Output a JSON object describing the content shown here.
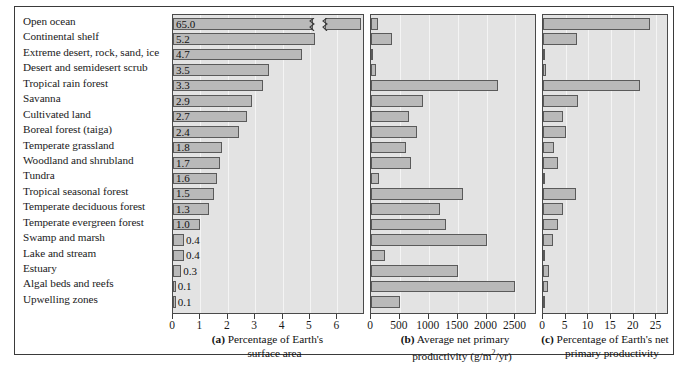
{
  "figure": {
    "ecosystems": [
      "Open ocean",
      "Continental shelf",
      "Extreme desert, rock, sand, ice",
      "Desert and semidesert scrub",
      "Tropical rain forest",
      "Savanna",
      "Cultivated land",
      "Boreal forest (taiga)",
      "Temperate grassland",
      "Woodland and shrubland",
      "Tundra",
      "Tropical seasonal forest",
      "Temperate deciduous forest",
      "Temperate evergreen forest",
      "Swamp and marsh",
      "Lake and stream",
      "Estuary",
      "Algal beds and reefs",
      "Upwelling zones"
    ],
    "panel_a": {
      "caption_letter": "(a)",
      "caption_line1": "Percentage of Earth's",
      "caption_line2": "surface area"
    },
    "panel_b": {
      "caption_letter": "(b)",
      "caption_line1": "Average net primary",
      "caption_line2_pre": "productivity (g/m",
      "caption_line2_sup": "2",
      "caption_line2_post": "/yr)"
    },
    "panel_c": {
      "caption_letter": "(c)",
      "caption_line1": "Percentage of Earth's net",
      "caption_line2": "primary productivity"
    },
    "colors": {
      "bar_fill": "#b9b9b9",
      "bar_stroke": "#5a5a5a",
      "panel_bg": "#e3e3e3",
      "frame": "#3a3a3a",
      "gridline": "#f4f4f4"
    }
  },
  "chart_data": [
    {
      "type": "bar",
      "id": "a",
      "title": "(a) Percentage of Earth's surface area",
      "orientation": "horizontal",
      "xlabel": "Percentage of Earth's surface area",
      "ylabel": "",
      "xlim": [
        0,
        6.5
      ],
      "xticks": [
        0,
        1,
        2,
        3,
        4,
        5,
        6
      ],
      "grid": true,
      "legend": "none",
      "axis_break": {
        "present": true,
        "series_index": 0,
        "note": "Open ocean bar (65.0) is truncated with a zigzag break symbol"
      },
      "categories": [
        "Open ocean",
        "Continental shelf",
        "Extreme desert, rock, sand, ice",
        "Desert and semidesert scrub",
        "Tropical rain forest",
        "Savanna",
        "Cultivated land",
        "Boreal forest (taiga)",
        "Temperate grassland",
        "Woodland and shrubland",
        "Tundra",
        "Tropical seasonal forest",
        "Temperate deciduous forest",
        "Temperate evergreen forest",
        "Swamp and marsh",
        "Lake and stream",
        "Estuary",
        "Algal beds and reefs",
        "Upwelling zones"
      ],
      "values": [
        65.0,
        5.2,
        4.7,
        3.5,
        3.3,
        2.9,
        2.7,
        2.4,
        1.8,
        1.7,
        1.6,
        1.5,
        1.3,
        1.0,
        0.4,
        0.4,
        0.3,
        0.1,
        0.1
      ],
      "data_labels": [
        "65.0",
        "5.2",
        "4.7",
        "3.5",
        "3.3",
        "2.9",
        "2.7",
        "2.4",
        "1.8",
        "1.7",
        "1.6",
        "1.5",
        "1.3",
        "1.0",
        "0.4",
        "0.4",
        "0.3",
        "0.1",
        "0.1"
      ]
    },
    {
      "type": "bar",
      "id": "b",
      "title": "(b) Average net primary productivity (g/m2/yr)",
      "orientation": "horizontal",
      "xlabel": "Average net primary productivity (g/m2/yr)",
      "ylabel": "",
      "xlim": [
        0,
        2700
      ],
      "xticks": [
        0,
        500,
        1000,
        1500,
        2000,
        2500
      ],
      "grid": true,
      "legend": "none",
      "categories": [
        "Open ocean",
        "Continental shelf",
        "Extreme desert, rock, sand, ice",
        "Desert and semidesert scrub",
        "Tropical rain forest",
        "Savanna",
        "Cultivated land",
        "Boreal forest (taiga)",
        "Temperate grassland",
        "Woodland and shrubland",
        "Tundra",
        "Tropical seasonal forest",
        "Temperate deciduous forest",
        "Temperate evergreen forest",
        "Swamp and marsh",
        "Lake and stream",
        "Estuary",
        "Algal beds and reefs",
        "Upwelling zones"
      ],
      "values": [
        125,
        360,
        3,
        90,
        2200,
        900,
        650,
        800,
        600,
        700,
        140,
        1600,
        1200,
        1300,
        2000,
        250,
        1500,
        2500,
        500
      ]
    },
    {
      "type": "bar",
      "id": "c",
      "title": "(c) Percentage of Earth's net primary productivity",
      "orientation": "horizontal",
      "xlabel": "Percentage of Earth's net primary productivity",
      "ylabel": "",
      "xlim": [
        0,
        26
      ],
      "xticks": [
        0,
        5,
        10,
        15,
        20,
        25
      ],
      "grid": true,
      "legend": "none",
      "categories": [
        "Open ocean",
        "Continental shelf",
        "Extreme desert, rock, sand, ice",
        "Desert and semidesert scrub",
        "Tropical rain forest",
        "Savanna",
        "Cultivated land",
        "Boreal forest (taiga)",
        "Temperate grassland",
        "Woodland and shrubland",
        "Tundra",
        "Tropical seasonal forest",
        "Temperate deciduous forest",
        "Temperate evergreen forest",
        "Swamp and marsh",
        "Lake and stream",
        "Estuary",
        "Algal beds and reefs",
        "Upwelling zones"
      ],
      "values": [
        23.5,
        7.5,
        0.05,
        0.6,
        21.3,
        7.7,
        4.4,
        5.0,
        2.5,
        3.2,
        0.5,
        7.2,
        4.4,
        3.4,
        2.2,
        0.5,
        1.4,
        1.0,
        0.1
      ]
    }
  ]
}
